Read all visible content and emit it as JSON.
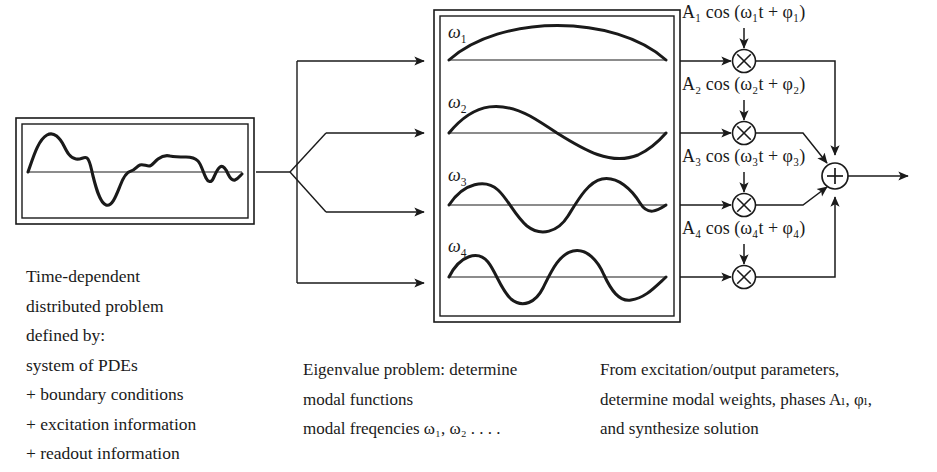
{
  "figure": {
    "ink_color": "#1a1a1a",
    "background": "#ffffff"
  },
  "input_panel": {
    "name": "time-signal-box",
    "waveform_description": "irregular time-domain signal with baseline axis"
  },
  "left_text": {
    "lines": [
      "Time-dependent",
      "distributed problem",
      "defined by:",
      "system of PDEs",
      "+ boundary conditions",
      "+ excitation information",
      "+ readout information"
    ]
  },
  "modal_panel": {
    "name": "modal-functions-box",
    "modes": [
      {
        "label": "ω",
        "index": "1",
        "cycles": 0.5,
        "phase_inverted": false
      },
      {
        "label": "ω",
        "index": "2",
        "cycles": 1.0,
        "phase_inverted": false
      },
      {
        "label": "ω",
        "index": "3",
        "cycles": 1.5,
        "phase_inverted": false
      },
      {
        "label": "ω",
        "index": "4",
        "cycles": 2.0,
        "phase_inverted": false
      }
    ]
  },
  "middle_caption": {
    "lines": [
      "Eigenvalue problem: determine",
      "modal functions",
      "modal freqencies ω₁, ω₂ . . . ."
    ]
  },
  "right_caption": {
    "lines": [
      "From excitation/output parameters,",
      "determine modal weights, phases Aₗ, φₗ,",
      "and synthesize solution"
    ]
  },
  "modulators": [
    {
      "name": "multiplier-1",
      "symbol": "×",
      "drive_label": "A₁ cos (ω₁t + φ₁)"
    },
    {
      "name": "multiplier-2",
      "symbol": "×",
      "drive_label": "A₂ cos (ω₂t + φ₂)"
    },
    {
      "name": "multiplier-3",
      "symbol": "×",
      "drive_label": "A₃ cos (ω₃t + φ₃)"
    },
    {
      "name": "multiplier-4",
      "symbol": "×",
      "drive_label": "A₄ cos (ω₄t + φ₄)"
    }
  ],
  "summing_junction": {
    "name": "summing-junction",
    "symbol": "+",
    "input_count": 4,
    "output": "synthesized solution"
  },
  "fanout": {
    "name": "fanout-splitter",
    "branch_count": 4
  }
}
